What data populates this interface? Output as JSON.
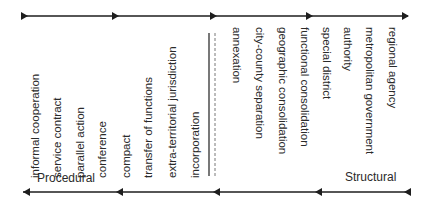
{
  "diagram": {
    "procedural_items": [
      {
        "label": "informal cooperation",
        "x": 28
      },
      {
        "label": "service contract",
        "x": 50
      },
      {
        "label": "parallel action",
        "x": 73
      },
      {
        "label": "conference",
        "x": 95
      },
      {
        "label": "compact",
        "x": 119
      },
      {
        "label": "transfer of functions",
        "x": 141
      },
      {
        "label": "extra-territorial jurisdiction",
        "x": 165
      },
      {
        "label": "incorporation",
        "x": 188
      }
    ],
    "structural_items": [
      {
        "label": "annexation",
        "x": 244
      },
      {
        "label": "city-county separation",
        "x": 267
      },
      {
        "label": "geographic consolidation",
        "x": 290
      },
      {
        "label": "functional consolidation",
        "x": 312
      },
      {
        "label": "special district",
        "x": 334
      },
      {
        "label": "authority",
        "x": 355
      },
      {
        "label": "metropolitan government",
        "x": 377
      },
      {
        "label": "regional agency",
        "x": 400
      }
    ],
    "left_end_label": "Procedural",
    "right_end_label": "Structural",
    "colors": {
      "line": "#1e1e1e",
      "text": "#2a2a2a"
    }
  }
}
